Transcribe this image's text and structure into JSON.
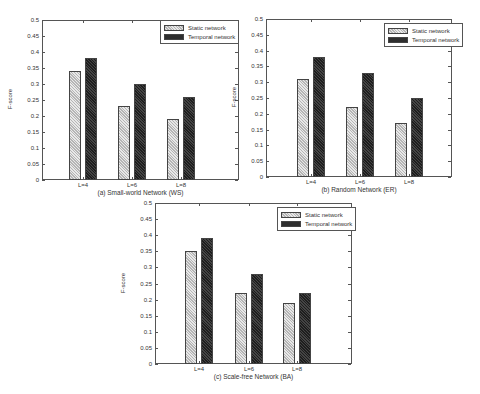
{
  "legend": {
    "static_label": "Static network",
    "temporal_label": "Temporal network"
  },
  "colors": {
    "static": "#d9d9d9",
    "temporal": "#2e2e2e"
  },
  "chart_data": [
    {
      "type": "bar",
      "title": "(a) Small-world Network (WS)",
      "xlabel": "",
      "ylabel": "F-score",
      "categories": [
        "L=4",
        "L=6",
        "L=8"
      ],
      "series": [
        {
          "name": "Static network",
          "values": [
            0.34,
            0.23,
            0.19
          ]
        },
        {
          "name": "Temporal network",
          "values": [
            0.38,
            0.3,
            0.26
          ]
        }
      ],
      "ylim": [
        0,
        0.5
      ],
      "yticks": [
        "0",
        "0.05",
        "0.1",
        "0.15",
        "0.2",
        "0.25",
        "0.3",
        "0.35",
        "0.4",
        "0.45",
        "0.5"
      ],
      "legend_position": "upper right",
      "grid": false
    },
    {
      "type": "bar",
      "title": "(b) Random Network (ER)",
      "xlabel": "",
      "ylabel": "F-score",
      "categories": [
        "L=4",
        "L=6",
        "L=8"
      ],
      "series": [
        {
          "name": "Static network",
          "values": [
            0.31,
            0.22,
            0.17
          ]
        },
        {
          "name": "Temporal network",
          "values": [
            0.38,
            0.33,
            0.25
          ]
        }
      ],
      "ylim": [
        0,
        0.5
      ],
      "yticks": [
        "0",
        "0.05",
        "0.1",
        "0.15",
        "0.2",
        "0.25",
        "0.3",
        "0.35",
        "0.4",
        "0.45",
        "0.5"
      ],
      "legend_position": "upper right",
      "grid": false
    },
    {
      "type": "bar",
      "title": "(c) Scale-free Network (BA)",
      "xlabel": "",
      "ylabel": "F-score",
      "categories": [
        "L=4",
        "L=6",
        "L=8"
      ],
      "series": [
        {
          "name": "Static network",
          "values": [
            0.35,
            0.22,
            0.19
          ]
        },
        {
          "name": "Temporal network",
          "values": [
            0.39,
            0.28,
            0.22
          ]
        }
      ],
      "ylim": [
        0,
        0.5
      ],
      "yticks": [
        "0",
        "0.05",
        "0.1",
        "0.15",
        "0.2",
        "0.25",
        "0.3",
        "0.35",
        "0.4",
        "0.45",
        "0.5"
      ],
      "legend_position": "upper right",
      "grid": false
    }
  ]
}
